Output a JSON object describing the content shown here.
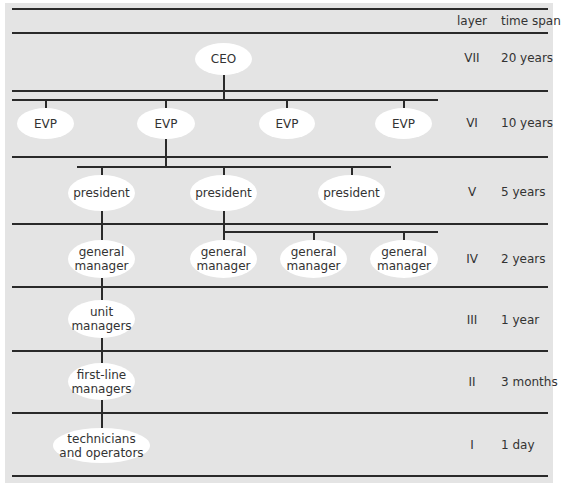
{
  "header": {
    "layer_label": "layer",
    "timespan_label": "time span"
  },
  "rows": [
    {
      "layer": "VII",
      "time_span": "20 years"
    },
    {
      "layer": "VI",
      "time_span": "10 years"
    },
    {
      "layer": "V",
      "time_span": "5 years"
    },
    {
      "layer": "IV",
      "time_span": "2 years"
    },
    {
      "layer": "III",
      "time_span": "1 year"
    },
    {
      "layer": "II",
      "time_span": "3 months"
    },
    {
      "layer": "I",
      "time_span": "1 day"
    }
  ],
  "nodes": {
    "ceo": "CEO",
    "evp": [
      "EVP",
      "EVP",
      "EVP",
      "EVP"
    ],
    "president": [
      "president",
      "president",
      "president"
    ],
    "general_manager": [
      "general\nmanager",
      "general\nmanager",
      "general\nmanager",
      "general\nmanager"
    ],
    "unit_managers": "unit\nmanagers",
    "first_line_managers": "first-line\nmanagers",
    "technicians": "technicians\nand operators"
  },
  "colors": {
    "background": "#e4e4e4",
    "node_fill": "#ffffff",
    "line": "#2a2a2a"
  }
}
